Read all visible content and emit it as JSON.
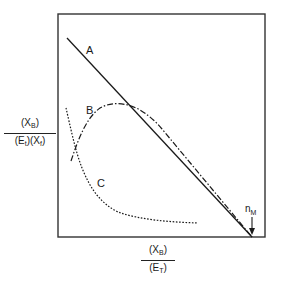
{
  "figure": {
    "y_axis_label": {
      "numerator": "(X",
      "numerator_sub": "B",
      "numerator_close": ")",
      "denominator_part1": "(E",
      "denominator_sub1": "t",
      "denominator_part2": ")(X",
      "denominator_sub2": "f",
      "denominator_close": ")"
    },
    "x_axis_label": {
      "numerator": "(X",
      "numerator_sub": "B",
      "numerator_close": ")",
      "denominator": "(E",
      "denominator_sub": "T",
      "denominator_close": ")"
    },
    "curves": [
      {
        "id": "A",
        "label": "A",
        "style": "solid"
      },
      {
        "id": "B",
        "label": "B",
        "style": "dash-dot"
      },
      {
        "id": "C",
        "label": "C",
        "style": "dotted"
      }
    ],
    "annotation": {
      "label": "n",
      "sub": "M"
    }
  }
}
